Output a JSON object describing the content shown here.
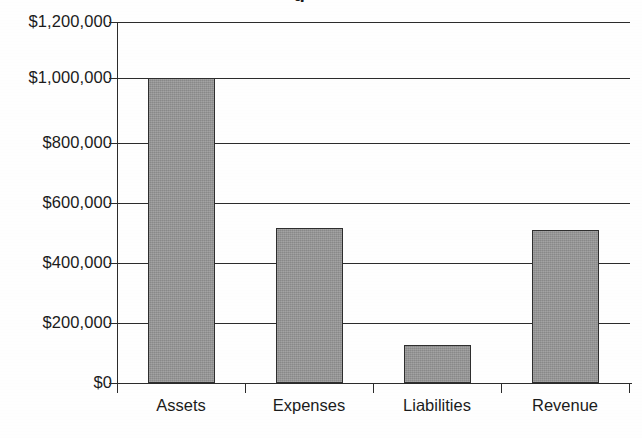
{
  "chart_data": {
    "type": "bar",
    "title": "",
    "title_fragment_visible": "g",
    "xlabel": "",
    "ylabel": "",
    "categories": [
      "Assets",
      "Expenses",
      "Liabilities",
      "Revenue"
    ],
    "values": [
      1015000,
      515000,
      128000,
      508000
    ],
    "ylim": [
      0,
      1200000
    ],
    "y_tick_values": [
      0,
      200000,
      400000,
      600000,
      800000,
      1000000,
      1200000
    ],
    "y_tick_labels": [
      "$0",
      "$200,000",
      "$400,000",
      "$600,000",
      "$800,000",
      "$1,000,000",
      "$1,200,000"
    ],
    "grid": true,
    "grid_axis": "y",
    "legend": false,
    "legend_position": "none",
    "bar_fill_color": "#969696",
    "bar_edge_color": "#2e2e2e",
    "axis_color": "#2b2b2b",
    "background_color": "#ffffff"
  },
  "axis": {
    "y_ticks": [
      {
        "label": "$1,200,000",
        "value": 1200000
      },
      {
        "label": "$1,000,000",
        "value": 1000000
      },
      {
        "label": "$800,000",
        "value": 800000
      },
      {
        "label": "$600,000",
        "value": 600000
      },
      {
        "label": "$400,000",
        "value": 400000
      },
      {
        "label": "$200,000",
        "value": 200000
      },
      {
        "label": "$0",
        "value": 0
      }
    ],
    "x_ticks": [
      {
        "label": "Assets"
      },
      {
        "label": "Expenses"
      },
      {
        "label": "Liabilities"
      },
      {
        "label": "Revenue"
      }
    ]
  }
}
